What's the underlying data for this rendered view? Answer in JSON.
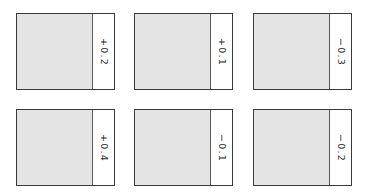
{
  "panels": [
    {
      "row": 1,
      "col": 1,
      "value": "+0.2"
    },
    {
      "row": 1,
      "col": 2,
      "value": "+0.1"
    },
    {
      "row": 1,
      "col": 3,
      "value": "−0.3"
    },
    {
      "row": 2,
      "col": 1,
      "value": "+0.4"
    },
    {
      "row": 2,
      "col": 2,
      "value": "−0.1"
    },
    {
      "row": 2,
      "col": 3,
      "value": "−0.2"
    }
  ],
  "colors": {
    "field": "#e4e4e4",
    "border": "#3a3a3a",
    "strip": "#ffffff",
    "text": "#2a2a2a"
  }
}
